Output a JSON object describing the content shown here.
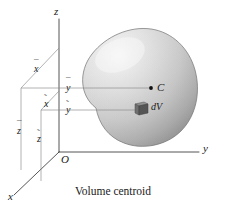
{
  "figure": {
    "caption": "Volume centroid",
    "background_color": "#ffffff",
    "ink_color": "#1a1a1a"
  },
  "axes": {
    "z_label": "z",
    "y_label": "y",
    "x_label": "x",
    "origin_label": "O"
  },
  "centroid": {
    "point_label": "C",
    "dot": "filled-dot"
  },
  "element": {
    "label": "dV",
    "fill_color": "#6e6e6e",
    "top_color": "#8e8e8e",
    "side_color": "#4a4a4a"
  },
  "coordinates": {
    "x_bar": {
      "base": "x",
      "accent": "¯",
      "name": "x-bar"
    },
    "y_bar": {
      "base": "y",
      "accent": "¯",
      "name": "y-bar"
    },
    "z_bar": {
      "base": "z",
      "accent": "¯",
      "name": "z-bar"
    },
    "x_tilde": {
      "base": "x",
      "accent": "˜",
      "name": "x-tilde"
    },
    "y_tilde": {
      "base": "y",
      "accent": "˜",
      "name": "y-tilde"
    },
    "z_tilde": {
      "base": "z",
      "accent": "˜",
      "name": "z-tilde"
    }
  },
  "body": {
    "name": "volume-blob",
    "shade_light": "#f2f2f2",
    "shade_mid": "#c9c9c9",
    "shade_dark": "#9a9a9a",
    "outline": "#6a6a6a"
  }
}
